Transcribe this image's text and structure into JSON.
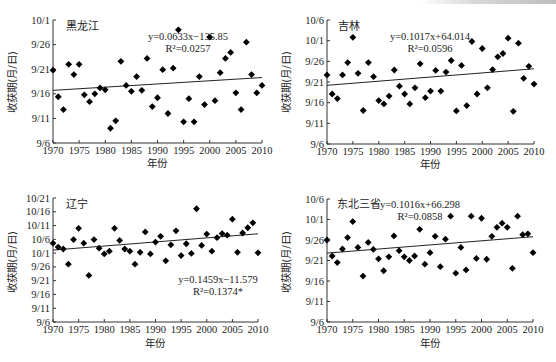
{
  "chart_data": [
    {
      "type": "scatter",
      "title": "黑龙江",
      "xlabel": "年份",
      "ylabel": "收获期(月/日)",
      "x_ticks": [
        1970,
        1975,
        1980,
        1985,
        1990,
        1995,
        2000,
        2005,
        2010
      ],
      "y_ticks": [
        "9/6",
        "9/11",
        "9/16",
        "9/21",
        "9/26",
        "10/1"
      ],
      "y_unit": "days after 9/6",
      "ylim": [
        0,
        25
      ],
      "xlim": [
        1970,
        2010
      ],
      "equation": "y=0.0633x−135.85",
      "r2": "R²=0.0257",
      "trend": {
        "start": [
          1970,
          10.7
        ],
        "end": [
          2010,
          13.3
        ]
      },
      "x": [
        1970,
        1971,
        1972,
        1973,
        1974,
        1975,
        1976,
        1977,
        1978,
        1979,
        1980,
        1981,
        1982,
        1983,
        1984,
        1985,
        1986,
        1987,
        1988,
        1989,
        1990,
        1991,
        1992,
        1993,
        1994,
        1995,
        1996,
        1997,
        1998,
        1999,
        2000,
        2001,
        2002,
        2003,
        2004,
        2005,
        2006,
        2007,
        2008,
        2009,
        2010
      ],
      "values": [
        14.8,
        9.4,
        6.8,
        16.0,
        13.9,
        16.0,
        9.8,
        8.4,
        10.0,
        11.2,
        10.8,
        3.0,
        4.5,
        16.6,
        11.7,
        10.5,
        13.5,
        10.7,
        17.2,
        7.4,
        9.2,
        14.9,
        6.0,
        15.2,
        23.0,
        4.3,
        9.0,
        4.3,
        13.5,
        7.8,
        21.5,
        8.6,
        14.3,
        17.2,
        18.4,
        10.2,
        6.8,
        20.5,
        13.9,
        10.2,
        11.7
      ],
      "grid": false
    },
    {
      "type": "scatter",
      "title": "吉林",
      "xlabel": "年份",
      "ylabel": "收获期(月/日)",
      "x_ticks": [
        1970,
        1975,
        1980,
        1985,
        1990,
        1995,
        2000,
        2005,
        2010
      ],
      "y_ticks": [
        "9/6",
        "9/11",
        "9/16",
        "9/21",
        "9/26",
        "10/1",
        "10/6"
      ],
      "y_unit": "days after 9/6",
      "ylim": [
        0,
        30
      ],
      "xlim": [
        1970,
        2010
      ],
      "equation": "y=0.1017x+64.014",
      "r2": "R²=0.0596",
      "trend": {
        "start": [
          1970,
          14.2
        ],
        "end": [
          2010,
          18.2
        ]
      },
      "x": [
        1970,
        1971,
        1972,
        1973,
        1974,
        1975,
        1976,
        1977,
        1978,
        1979,
        1980,
        1981,
        1982,
        1983,
        1984,
        1985,
        1986,
        1987,
        1988,
        1989,
        1990,
        1991,
        1992,
        1993,
        1994,
        1995,
        1996,
        1997,
        1998,
        1999,
        2000,
        2001,
        2002,
        2003,
        2004,
        2005,
        2006,
        2007,
        2008,
        2009,
        2010
      ],
      "values": [
        16.7,
        12.1,
        11.0,
        16.7,
        19.7,
        25.8,
        17.1,
        8.1,
        19.7,
        16.3,
        10.5,
        9.7,
        11.6,
        17.9,
        14.0,
        12.1,
        9.7,
        13.6,
        19.4,
        11.2,
        12.8,
        17.8,
        12.8,
        17.4,
        20.2,
        8.0,
        19.0,
        9.3,
        24.8,
        12.1,
        23.1,
        13.6,
        18.0,
        21.1,
        21.9,
        25.6,
        7.9,
        24.4,
        15.9,
        18.8,
        14.5
      ],
      "grid": false
    },
    {
      "type": "scatter",
      "title": "辽宁",
      "xlabel": "年份",
      "ylabel": "收获期(月/日)",
      "x_ticks": [
        1970,
        1975,
        1980,
        1985,
        1990,
        1995,
        2000,
        2005,
        2010
      ],
      "y_ticks": [
        "9/6",
        "9/11",
        "9/16",
        "9/21",
        "9/26",
        "10/1",
        "10/6",
        "10/11",
        "10/16",
        "10/21"
      ],
      "y_unit": "days after 9/6",
      "ylim": [
        0,
        45
      ],
      "xlim": [
        1970,
        2010
      ],
      "equation": "y=0.1459x−11.579",
      "r2": "R²=0.1374*",
      "trend": {
        "start": [
          1970,
          26.1
        ],
        "end": [
          2010,
          32.0
        ]
      },
      "x": [
        1970,
        1971,
        1972,
        1973,
        1974,
        1975,
        1976,
        1977,
        1978,
        1979,
        1980,
        1981,
        1982,
        1983,
        1984,
        1985,
        1986,
        1987,
        1988,
        1989,
        1990,
        1991,
        1992,
        1993,
        1994,
        1995,
        1996,
        1997,
        1998,
        1999,
        2000,
        2001,
        2002,
        2003,
        2004,
        2005,
        2006,
        2007,
        2008,
        2009,
        2010
      ],
      "values": [
        28.6,
        27.2,
        26.5,
        21.0,
        29.9,
        34.0,
        28.6,
        16.9,
        29.9,
        26.8,
        24.7,
        25.7,
        34.0,
        29.6,
        26.5,
        25.7,
        21.0,
        25.3,
        32.7,
        24.7,
        29.0,
        31.1,
        22.2,
        28.0,
        33.1,
        24.1,
        28.4,
        24.9,
        41.1,
        27.8,
        31.9,
        25.7,
        30.6,
        32.1,
        31.5,
        37.3,
        25.3,
        32.3,
        34.2,
        36.0,
        25.1
      ],
      "grid": false
    },
    {
      "type": "scatter",
      "title": "东北三省",
      "xlabel": "年份",
      "ylabel": "收获期(月/日)",
      "x_ticks": [
        1970,
        1975,
        1980,
        1985,
        1990,
        1995,
        2000,
        2005,
        2010
      ],
      "y_ticks": [
        "9/6",
        "9/11",
        "9/16",
        "9/21",
        "9/26",
        "10/1",
        "10/6"
      ],
      "y_unit": "days after 9/6",
      "ylim": [
        0,
        30
      ],
      "xlim": [
        1970,
        2010
      ],
      "equation": "y=0.1016x+66.298",
      "r2": "R²=0.0858",
      "trend": {
        "start": [
          1970,
          16.8
        ],
        "end": [
          2010,
          20.8
        ]
      },
      "x": [
        1970,
        1971,
        1972,
        1973,
        1974,
        1975,
        1976,
        1977,
        1978,
        1979,
        1980,
        1981,
        1982,
        1983,
        1984,
        1985,
        1986,
        1987,
        1988,
        1989,
        1990,
        1991,
        1992,
        1993,
        1994,
        1995,
        1996,
        1997,
        1998,
        1999,
        2000,
        2001,
        2002,
        2003,
        2004,
        2005,
        2006,
        2007,
        2008,
        2009,
        2010
      ],
      "values": [
        20.0,
        16.1,
        14.5,
        17.8,
        20.6,
        24.5,
        18.2,
        11.2,
        19.4,
        17.7,
        15.4,
        12.5,
        15.9,
        21.0,
        17.4,
        15.9,
        15.0,
        16.1,
        22.6,
        14.1,
        16.9,
        20.9,
        13.5,
        20.2,
        25.8,
        11.9,
        18.2,
        12.7,
        25.8,
        15.5,
        25.3,
        15.3,
        20.9,
        23.1,
        24.1,
        23.1,
        13.1,
        25.8,
        21.3,
        21.5,
        16.9
      ],
      "grid": false
    }
  ],
  "panels": [
    {
      "title": "黑龙江",
      "xlabel": "年份",
      "ylabel": "收获期(月/日)",
      "equation": "y=0.0633x−135.85",
      "r2": "R²=0.0257"
    },
    {
      "title": "吉林",
      "xlabel": "年份",
      "ylabel": "收获期(月/日)",
      "equation": "y=0.1017x+64.014",
      "r2": "R²=0.0596"
    },
    {
      "title": "辽宁",
      "xlabel": "年份",
      "ylabel": "收获期(月/日)",
      "equation": "y=0.1459x−11.579",
      "r2": "R²=0.1374*"
    },
    {
      "title": "东北三省",
      "xlabel": "年份",
      "ylabel": "收获期(月/日)",
      "equation": "y=0.1016x+66.298",
      "r2": "R²=0.0858"
    }
  ]
}
